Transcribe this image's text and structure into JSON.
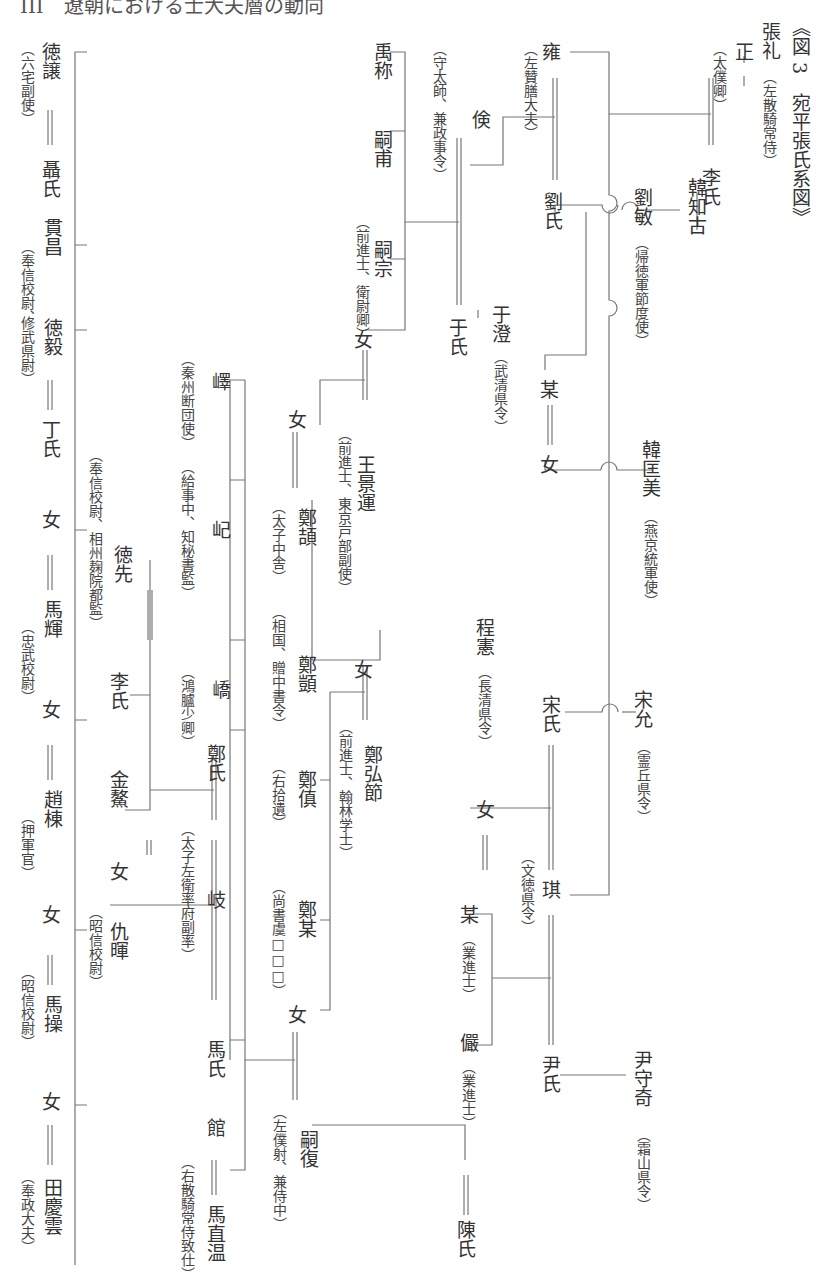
{
  "running_header": "III　遼朝における士大夫層の動向",
  "title": "《図 3　宛平張氏系図》",
  "persons": {
    "zhang_li": {
      "name": "張礼",
      "title": "（左散騎常侍）"
    },
    "zheng": {
      "name": "正",
      "title": "（太僕卿）"
    },
    "li_shi_1": {
      "name": "李氏"
    },
    "yong": {
      "name": "雍",
      "title": "（左贊膳大夫）"
    },
    "liu_shi": {
      "name": "劉氏"
    },
    "liu_min": {
      "name": "劉敏",
      "title": "（帰徳軍節度使）"
    },
    "han_zhigu": {
      "name": "韓知古"
    },
    "han_kuangmei": {
      "name": "韓匡美",
      "title": "（燕京統軍使）"
    },
    "mou_1": {
      "name": "某"
    },
    "nu_1": {
      "name": "女"
    },
    "yu_cheng": {
      "name": "于澄",
      "title": "（武清県令）"
    },
    "jian": {
      "name": "倹",
      "title": "（守太師、兼政事令）"
    },
    "yu_shi": {
      "name": "于氏"
    },
    "yu_cheng2": {
      "name": "禹称"
    },
    "si_fu": {
      "name": "嗣甫"
    },
    "si_zong": {
      "name": "嗣宗",
      "title": "（前進士、衛尉卿）"
    },
    "nu_2": {
      "name": "女"
    },
    "wang_jingyun": {
      "name": "王景運",
      "title": "（前進士、東京戸部副使）"
    },
    "nu_3": {
      "name": "女"
    },
    "zheng_hong": {
      "name": "鄭頡",
      "title": "（太子中舎）"
    },
    "zheng_xu": {
      "name": "鄭顗",
      "title": "（相国、贈中書令）"
    },
    "nu_4": {
      "name": "女"
    },
    "zheng_hongjie": {
      "name": "鄭弘節",
      "title": "（前進士、翰林学士）"
    },
    "zheng_zhen": {
      "name": "鄭傎",
      "title": "（右拾遺）"
    },
    "zheng_mou": {
      "name": "鄭某",
      "title": "（尚書虞□□□）"
    },
    "nu_5": {
      "name": "女"
    },
    "si_fu2": {
      "name": "嗣復",
      "title": "（左僕射、兼侍中）"
    },
    "cheng_xian": {
      "name": "程憲",
      "title": "（長清県令）"
    },
    "nu_6": {
      "name": "女"
    },
    "song_yun": {
      "name": "宋允",
      "title": "（霊丘県令）"
    },
    "song_shi": {
      "name": "宋氏"
    },
    "qi": {
      "name": "琪",
      "title": "（文徳県令）"
    },
    "mou_2": {
      "name": "某",
      "title": "（業進士）"
    },
    "yan": {
      "name": "儼",
      "title": "（業進士）"
    },
    "yin_shi": {
      "name": "尹氏"
    },
    "yin_shouqi": {
      "name": "尹守奇",
      "title": "（霜山県令）"
    },
    "chen_shi": {
      "name": "陳氏"
    },
    "yi": {
      "name": "嶧",
      "title": "（秦州断団使）"
    },
    "ji": {
      "name": "屺",
      "title": "（給事中、知秘書監）"
    },
    "qiao": {
      "name": "嶠",
      "title": "（鴻臚少卿）"
    },
    "zheng_shi": {
      "name": "鄭氏"
    },
    "qi2": {
      "name": "岐",
      "title": "（太子左衛率府副率）"
    },
    "ma_shi": {
      "name": "馬氏"
    },
    "guan": {
      "name": "館"
    },
    "ma_zhiwen": {
      "name": "馬直温",
      "title": "（右散騎常侍致仕）"
    },
    "de_rang": {
      "name": "徳譲",
      "title": "（六宅副使）"
    },
    "nie_shi": {
      "name": "聶氏"
    },
    "guan_chang": {
      "name": "貫昌",
      "title": "（奉信校尉、"
    },
    "de_yi": {
      "name": "徳毅",
      "title": "修武県尉）"
    },
    "ding_shi": {
      "name": "丁氏"
    },
    "de_xian": {
      "name": "徳先",
      "title": "（奉信校尉、相州麹院都監）"
    },
    "li_shi_2": {
      "name": "李氏"
    },
    "jin_ao": {
      "name": "金鰲"
    },
    "nu_7": {
      "name": "女"
    },
    "chou_hui": {
      "name": "仇暉",
      "title": "（昭信校尉）"
    },
    "nu_8": {
      "name": "女"
    },
    "ma_hui": {
      "name": "馬輝",
      "title": "（忠武校尉）"
    },
    "nu_9": {
      "name": "女"
    },
    "zhao_dong": {
      "name": "趙棟",
      "title": "（押軍官）"
    },
    "nu_10": {
      "name": "女"
    },
    "ma_cao": {
      "name": "馬操",
      "title": "（昭信校尉）"
    },
    "nu_11": {
      "name": "女"
    },
    "tian_qingyun": {
      "name": "田慶雲",
      "title": "（奉政大夫）"
    }
  },
  "marriage_symbol": "＝"
}
